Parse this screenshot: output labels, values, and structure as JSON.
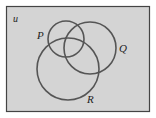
{
  "diagram": {
    "type": "venn",
    "universe_label": "u",
    "sets": [
      {
        "name": "P",
        "label": "P",
        "cx": 66,
        "cy": 39,
        "r": 18
      },
      {
        "name": "Q",
        "label": "Q",
        "cx": 90,
        "cy": 48,
        "r": 26
      },
      {
        "name": "R",
        "label": "R",
        "cx": 68,
        "cy": 69,
        "r": 31
      }
    ],
    "colors": {
      "background": "#d4d4d4",
      "frame": "#444444",
      "circle_stroke": "#555555",
      "label": "#222222"
    }
  }
}
